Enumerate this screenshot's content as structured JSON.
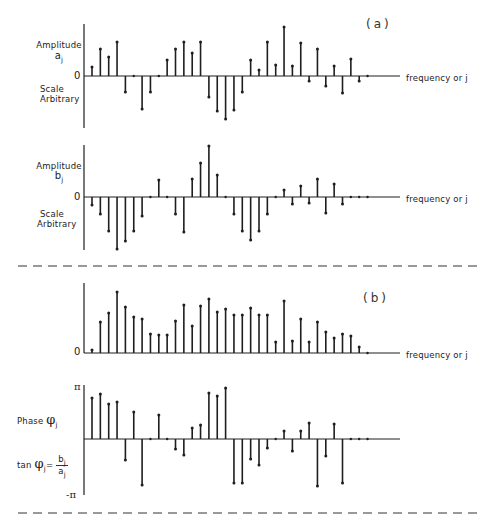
{
  "panels": {
    "a": {
      "tag": "(a)"
    },
    "b": {
      "tag": "(b)"
    }
  },
  "labels": {
    "aj_amplitude": "Amplitude",
    "aj_symbol": "a",
    "aj_sub": "j",
    "aj_zero": "0",
    "aj_scale": "Scale",
    "aj_arbitrary": "Arbitrary",
    "aj_xlabel": "frequency or j",
    "bj_amplitude": "Amplitude",
    "bj_symbol": "b",
    "bj_sub": "j",
    "bj_zero": "0",
    "bj_scale": "Scale",
    "bj_arbitrary": "Arbitrary",
    "bj_xlabel": "frequency or j",
    "mag_zero": "0",
    "mag_xlabel": "frequency or j",
    "phase_title": "Phase",
    "phase_symbol": "φ",
    "phase_sub": "j",
    "pi_top": "π",
    "pi_bottom": "-π",
    "tan_prefix": "tan",
    "tan_symbol": "φ",
    "tan_sub": "j",
    "tan_eq": "=",
    "tan_num": "b",
    "tan_num_sub": "j",
    "tan_den": "a",
    "tan_den_sub": "j"
  },
  "chart_data": [
    {
      "type": "stem",
      "title": "(a) Amplitude a_j",
      "xlabel": "frequency or j",
      "ylabel": "Amplitude a_j (Scale Arbitrary)",
      "x": [
        0,
        1,
        2,
        3,
        4,
        5,
        6,
        7,
        8,
        9,
        10,
        11,
        12,
        13,
        14,
        15,
        16,
        17,
        18,
        19,
        20,
        21,
        22,
        23,
        24,
        25,
        26,
        27,
        28,
        29,
        30,
        31,
        32,
        33
      ],
      "values": [
        9,
        27,
        19,
        34,
        -16,
        0,
        -33,
        -16,
        0,
        16,
        27,
        34,
        23,
        34,
        -21,
        -35,
        -43,
        -34,
        -16,
        16,
        6,
        34,
        11,
        49,
        10,
        33,
        -5,
        27,
        -10,
        10,
        -17,
        17,
        -5,
        0
      ],
      "zero_y": 76,
      "axis_top": 24,
      "axis_bottom": 128
    },
    {
      "type": "stem",
      "title": "Amplitude b_j",
      "xlabel": "frequency or j",
      "ylabel": "Amplitude b_j (Scale Arbitrary)",
      "x": [
        0,
        1,
        2,
        3,
        4,
        5,
        6,
        7,
        8,
        9,
        10,
        11,
        12,
        13,
        14,
        15,
        16,
        17,
        18,
        19,
        20,
        21,
        22,
        23,
        24,
        25,
        26,
        27,
        28,
        29,
        30,
        31,
        32,
        33
      ],
      "values": [
        -8,
        -17,
        -34,
        -52,
        -44,
        -34,
        -19,
        0,
        17,
        0,
        -17,
        -35,
        18,
        34,
        51,
        22,
        0,
        -17,
        -34,
        -43,
        -34,
        -17,
        0,
        7,
        -7,
        11,
        -6,
        18,
        -16,
        13,
        -7,
        0,
        0,
        0
      ],
      "zero_y": 197,
      "axis_top": 145,
      "axis_bottom": 250
    },
    {
      "type": "stem",
      "title": "(b) Magnitude",
      "xlabel": "frequency or j",
      "ylabel": "",
      "x": [
        0,
        1,
        2,
        3,
        4,
        5,
        6,
        7,
        8,
        9,
        10,
        11,
        12,
        13,
        14,
        15,
        16,
        17,
        18,
        19,
        20,
        21,
        22,
        23,
        24,
        25,
        26,
        27,
        28,
        29,
        30,
        31,
        32,
        33
      ],
      "values": [
        3,
        31,
        40,
        61,
        46,
        36,
        34,
        19,
        18,
        18,
        32,
        48,
        27,
        47,
        54,
        41,
        44,
        38,
        38,
        45,
        38,
        38,
        11,
        52,
        12,
        34,
        11,
        31,
        21,
        15,
        19,
        17,
        6,
        0
      ],
      "zero_y": 353,
      "axis_top": 283,
      "axis_bottom": 353
    },
    {
      "type": "stem",
      "title": "Phase φ_j",
      "xlabel": "frequency or j",
      "ylabel": "Phase φ_j, tan φ_j = b_j / a_j",
      "ylim": [
        "-π",
        "π"
      ],
      "x": [
        0,
        1,
        2,
        3,
        4,
        5,
        6,
        7,
        8,
        9,
        10,
        11,
        12,
        13,
        14,
        15,
        16,
        17,
        18,
        19,
        20,
        21,
        22,
        23,
        24,
        25,
        26,
        27,
        28,
        29,
        30,
        31,
        32,
        33
      ],
      "values": [
        41,
        45,
        35,
        37,
        -21,
        27,
        -46,
        0,
        24,
        0,
        -10,
        -16,
        11,
        14,
        46,
        43,
        51,
        -44,
        -44,
        -20,
        -26,
        -9,
        0,
        8,
        -12,
        8,
        16,
        -47,
        -17,
        15,
        -44,
        0,
        0,
        0
      ],
      "zero_y": 439,
      "axis_top": 385,
      "axis_bottom": 495
    }
  ],
  "dividers": [
    {
      "y": 266
    },
    {
      "y": 513
    }
  ]
}
